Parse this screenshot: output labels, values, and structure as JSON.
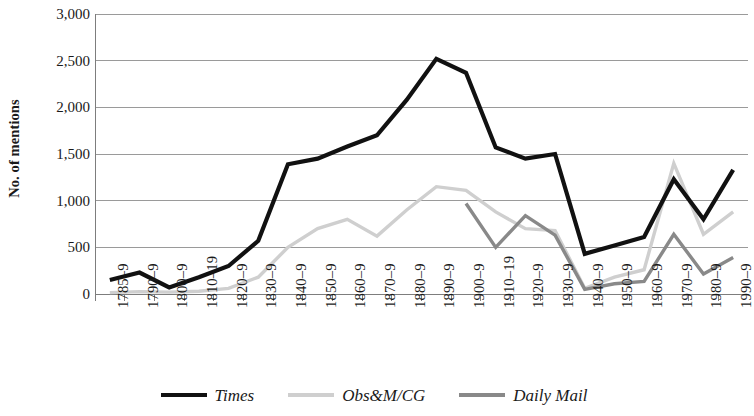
{
  "chart_data": {
    "type": "line",
    "title": "",
    "xlabel": "",
    "ylabel": "No. of mentions",
    "ylim": [
      0,
      3000
    ],
    "ytick_step": 500,
    "yticks": [
      "0",
      "500",
      "1,000",
      "1,500",
      "2,000",
      "2,500",
      "3,000"
    ],
    "grid": true,
    "legend_position": "bottom",
    "categories": [
      "1785–9",
      "1790–9",
      "1800–9",
      "1810–19",
      "1820–9",
      "1830–9",
      "1840–9",
      "1850–9",
      "1860–9",
      "1870–9",
      "1880–9",
      "1890–9",
      "1900–9",
      "1910–19",
      "1920–9",
      "1930–9",
      "1940–9",
      "1950–9",
      "1960–9",
      "1970–9",
      "1980–9",
      "1990–9"
    ],
    "series": [
      {
        "name": "Times",
        "color": "#111111",
        "values": [
          150,
          230,
          70,
          180,
          300,
          570,
          1390,
          1450,
          1580,
          1700,
          2080,
          2520,
          2370,
          1570,
          1450,
          1500,
          430,
          520,
          610,
          1230,
          800,
          1330
        ]
      },
      {
        "name": "Obs&M/CG",
        "color": "#cfcfcf",
        "values": [
          15,
          25,
          20,
          30,
          60,
          180,
          500,
          700,
          800,
          620,
          900,
          1150,
          1110,
          880,
          700,
          680,
          60,
          180,
          260,
          1400,
          640,
          880
        ]
      },
      {
        "name": "Daily Mail",
        "color": "#898989",
        "values": [
          null,
          null,
          null,
          null,
          null,
          null,
          null,
          null,
          null,
          null,
          null,
          null,
          970,
          500,
          840,
          630,
          50,
          110,
          135,
          640,
          215,
          390
        ]
      }
    ]
  },
  "legend": {
    "items": [
      {
        "label": "Times",
        "color": "#111111"
      },
      {
        "label": "Obs&M/CG",
        "color": "#cfcfcf"
      },
      {
        "label": "Daily Mail",
        "color": "#898989"
      }
    ]
  },
  "axes": {
    "y_title": "No. of mentions",
    "axis_color": "#7d7d7d",
    "grid_color": "#9a9a9a"
  }
}
